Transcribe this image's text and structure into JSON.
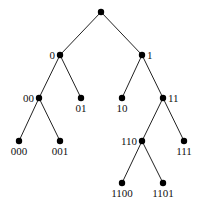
{
  "diagram": {
    "type": "binary-tree",
    "nodes": [
      {
        "id": "root",
        "label": "",
        "x": 101,
        "y": 12
      },
      {
        "id": "0",
        "label": "0",
        "x": 60,
        "y": 55,
        "label_pos": "left"
      },
      {
        "id": "1",
        "label": "1",
        "x": 142,
        "y": 55,
        "label_pos": "right"
      },
      {
        "id": "00",
        "label": "00",
        "x": 39,
        "y": 98,
        "label_pos": "left"
      },
      {
        "id": "01",
        "label": "01",
        "x": 81,
        "y": 98,
        "label_pos": "below"
      },
      {
        "id": "10",
        "label": "10",
        "x": 122,
        "y": 98,
        "label_pos": "below"
      },
      {
        "id": "11",
        "label": "11",
        "x": 163,
        "y": 98,
        "label_pos": "right"
      },
      {
        "id": "000",
        "label": "000",
        "x": 19,
        "y": 141,
        "label_pos": "below"
      },
      {
        "id": "001",
        "label": "001",
        "x": 60,
        "y": 141,
        "label_pos": "below"
      },
      {
        "id": "110",
        "label": "110",
        "x": 142,
        "y": 141,
        "label_pos": "left"
      },
      {
        "id": "111",
        "label": "111",
        "x": 184,
        "y": 141,
        "label_pos": "below"
      },
      {
        "id": "1100",
        "label": "1100",
        "x": 122,
        "y": 183,
        "label_pos": "below"
      },
      {
        "id": "1101",
        "label": "1101",
        "x": 163,
        "y": 183,
        "label_pos": "below"
      }
    ],
    "edges": [
      [
        "root",
        "0"
      ],
      [
        "root",
        "1"
      ],
      [
        "0",
        "00"
      ],
      [
        "0",
        "01"
      ],
      [
        "1",
        "10"
      ],
      [
        "1",
        "11"
      ],
      [
        "00",
        "000"
      ],
      [
        "00",
        "001"
      ],
      [
        "11",
        "110"
      ],
      [
        "11",
        "111"
      ],
      [
        "110",
        "1100"
      ],
      [
        "110",
        "1101"
      ]
    ]
  },
  "colors": {
    "node": "#000000",
    "edge": "#222222",
    "background": "#ffffff"
  }
}
